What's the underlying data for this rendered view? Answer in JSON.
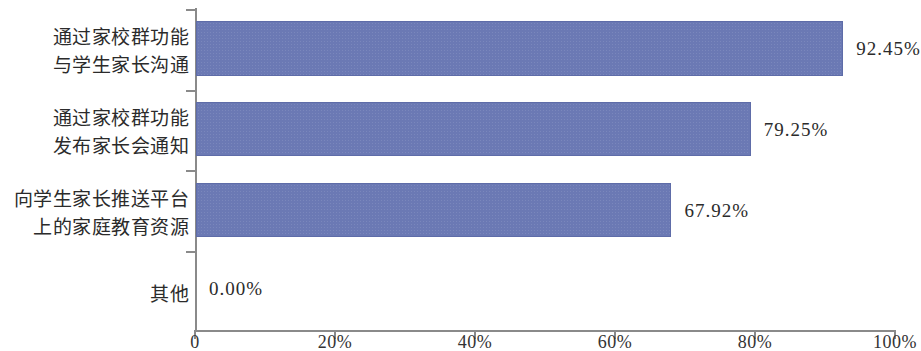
{
  "chart_data": {
    "type": "bar",
    "orientation": "horizontal",
    "title": "",
    "subtitle": "",
    "xlabel": "",
    "ylabel": "",
    "categories": [
      "通过家校群功能\n与学生家长沟通",
      "通过家校群功能\n发布家长会通知",
      "向学生家长推送平台\n上的家庭教育资源",
      "其他"
    ],
    "values": [
      92.45,
      79.25,
      67.92,
      0.0
    ],
    "value_labels": [
      "92.45%",
      "79.25%",
      "67.92%",
      "0.00%"
    ],
    "xlim": [
      0,
      100
    ],
    "xticks": [
      0,
      20,
      40,
      60,
      80,
      100
    ],
    "xtick_labels": [
      "0",
      "20%",
      "40%",
      "60%",
      "80%",
      "100%"
    ],
    "grid": false,
    "legend": false,
    "bar_color": "#6b79b4",
    "axis_color": "#8a8a8a",
    "text_color": "#2b2b2b",
    "background": "#ffffff"
  }
}
